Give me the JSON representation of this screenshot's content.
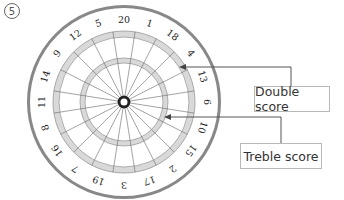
{
  "figure": {
    "number_label": "⑤",
    "labels": {
      "double": "Double score",
      "treble": "Treble score"
    },
    "numbers_clockwise_from_top": [
      20,
      1,
      18,
      4,
      13,
      6,
      10,
      15,
      2,
      17,
      3,
      19,
      7,
      16,
      8,
      11,
      14,
      9,
      12,
      5
    ],
    "colors": {
      "ring_fill": "#d9d9d9",
      "rim": "#888888",
      "lines": "#666666",
      "bull": "#222222",
      "leader": "#555555"
    }
  }
}
